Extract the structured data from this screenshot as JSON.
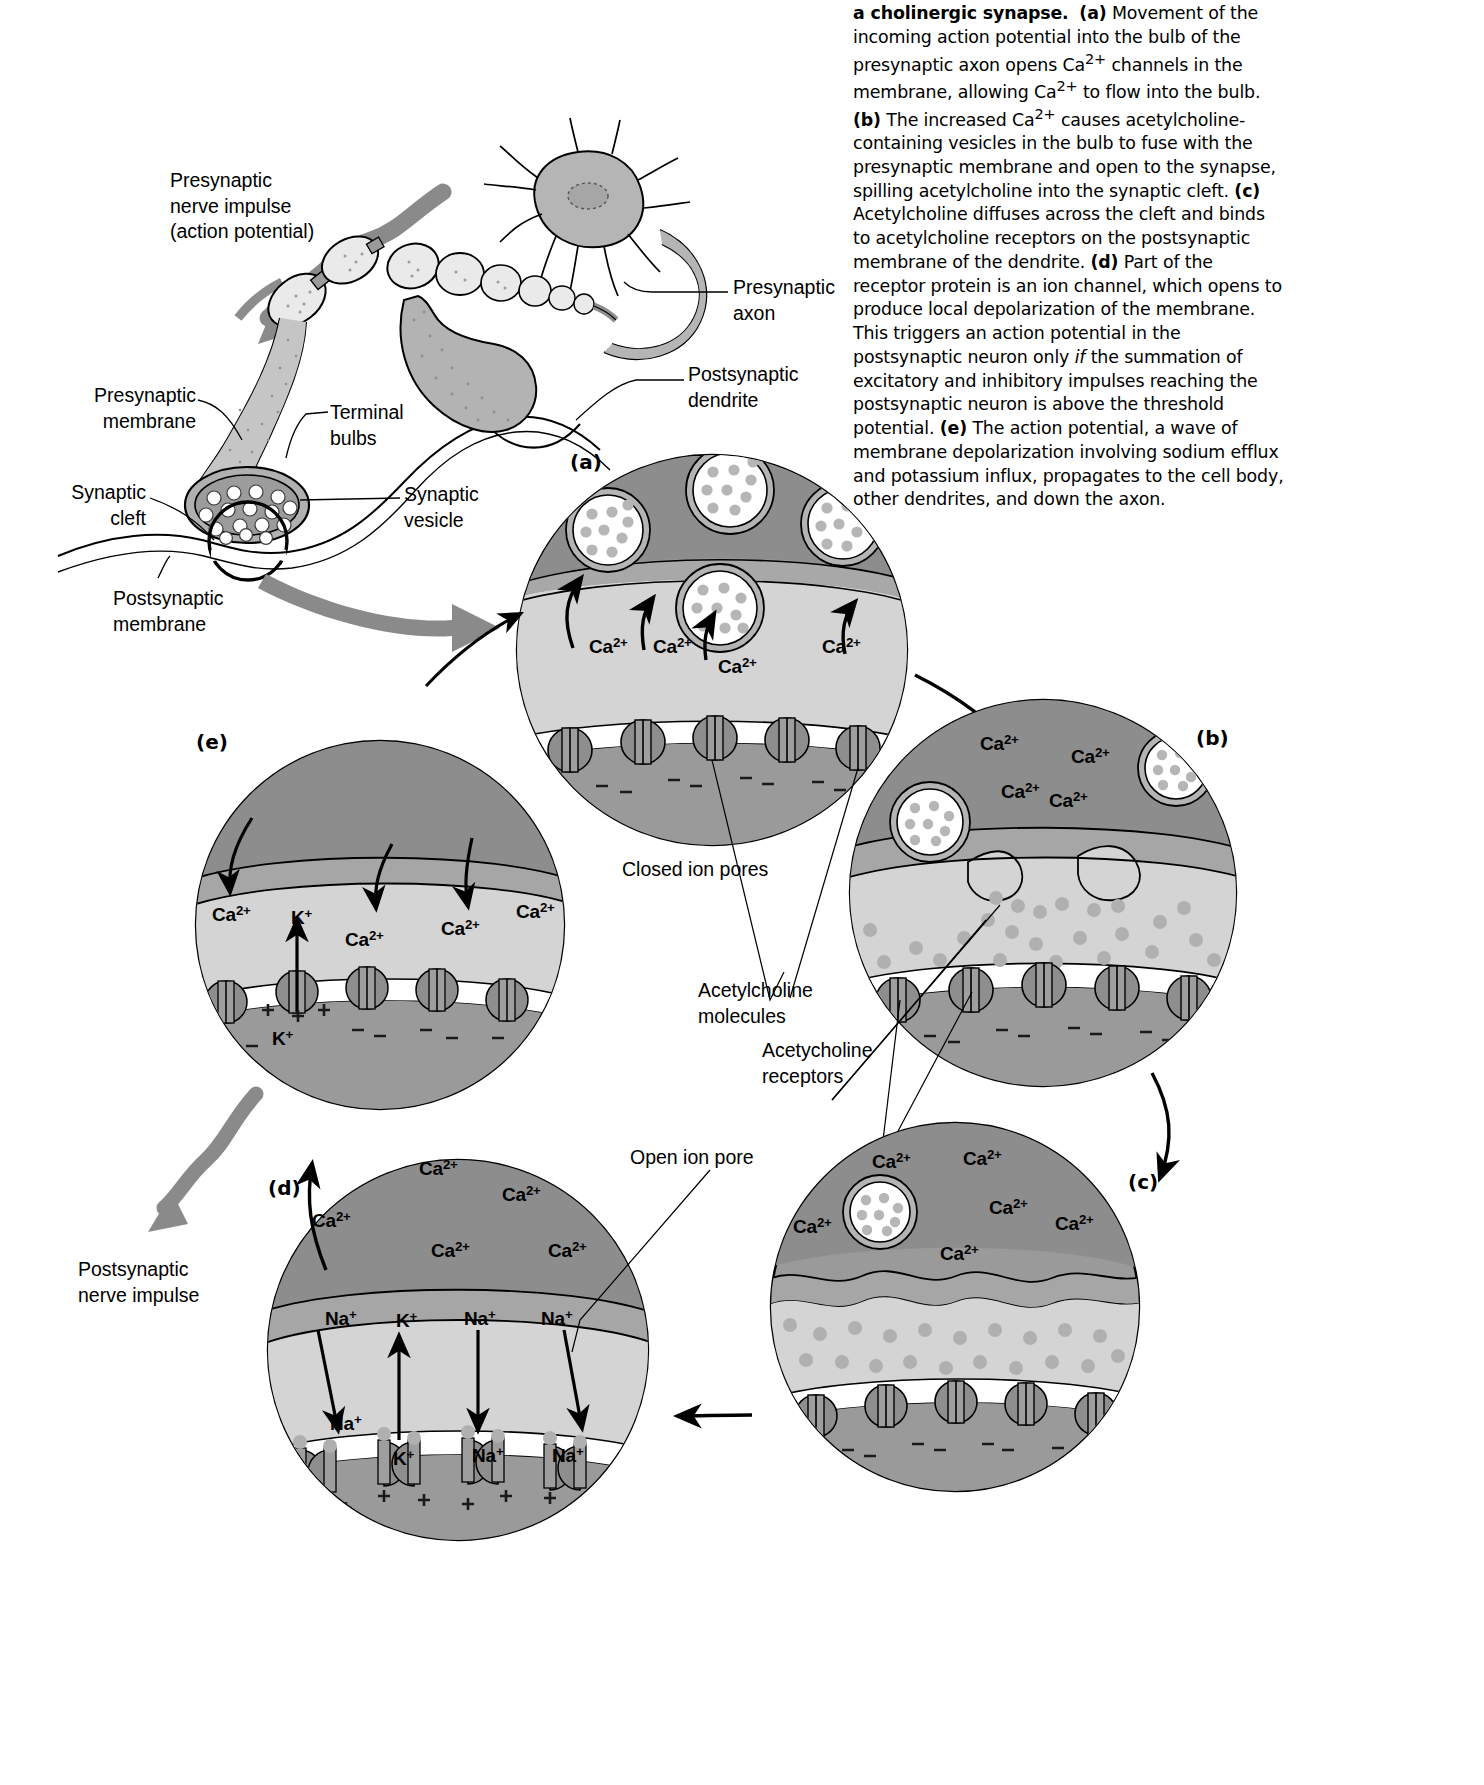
{
  "figure": {
    "caption_html": "<b>a cholinergic synapse.</b> &nbsp;<b>(a)</b> Movement of the incoming action potential into the bulb of the presynaptic axon opens Ca<sup>2+</sup> channels in the membrane, allowing Ca<sup>2+</sup> to flow into the bulb. <b>(b)</b> The increased Ca<sup>2+</sup> causes acetylcholine-containing vesicles in the bulb to fuse with the presynaptic membrane and open to the synapse, spilling acetylcholine into the synaptic cleft. <b>(c)</b> Acetylcholine diffuses across the cleft and binds to acetylcholine receptors on the postsynaptic membrane of the dendrite. <b>(d)</b> Part of the receptor protein is an ion channel, which opens to produce local depolarization of the membrane. This triggers an action potential in the postsynaptic neuron only <i>if</i> the summation of excitatory and inhibitory impulses reaching the postsynaptic neuron is above the threshold potential. <b>(e)</b> The action potential, a wave of membrane depolarization involving sodium efflux and potassium influx, propagates to the cell body, other dendrites, and down the axon.",
    "caption_plain": "a cholinergic synapse. (a) Movement of the incoming action potential into the bulb of the presynaptic axon opens Ca2+ channels in the membrane, allowing Ca2+ to flow into the bulb. (b) The increased Ca2+ causes acetylcholine-containing vesicles in the bulb to fuse with the presynaptic membrane and open to the synapse, spilling acetylcholine into the synaptic cleft. (c) Acetylcholine diffuses across the cleft and binds to acetylcholine receptors on the postsynaptic membrane of the dendrite. (d) Part of the receptor protein is an ion channel, which opens to produce local depolarization of the membrane. This triggers an action potential in the postsynaptic neuron only if the summation of excitatory and inhibitory impulses reaching the postsynaptic neuron is above the threshold potential. (e) The action potential, a wave of membrane depolarization involving sodium efflux and potassium influx, propagates to the cell body, other dendrites, and down the axon."
  },
  "overview_labels": {
    "presynaptic_impulse": "Presynaptic\nnerve impulse\n(action potential)",
    "presynaptic_axon": "Presynaptic\naxon",
    "presynaptic_membrane": "Presynaptic\nmembrane",
    "terminal_bulbs": "Terminal\nbulbs",
    "postsynaptic_dendrite": "Postsynaptic\ndendrite",
    "synaptic_cleft": "Synaptic\ncleft",
    "postsynaptic_membrane": "Postsynaptic\nmembrane",
    "synaptic_vesicle": "Synaptic\nvesicle",
    "postsynaptic_impulse": "Postsynaptic\nnerve impulse"
  },
  "callout_labels": {
    "closed_ion_pores": "Closed ion pores",
    "acetylcholine_molecules": "Acetylcholine\nmolecules",
    "acetylcholine_receptors": "Acetycholine\nreceptors",
    "open_ion_pore": "Open ion pore"
  },
  "panels": [
    {
      "id": "a",
      "letter": "(a)"
    },
    {
      "id": "b",
      "letter": "(b)"
    },
    {
      "id": "c",
      "letter": "(c)"
    },
    {
      "id": "d",
      "letter": "(d)"
    },
    {
      "id": "e",
      "letter": "(e)"
    }
  ],
  "ions": {
    "calcium": "Ca",
    "sodium": "Na",
    "potassium": "K",
    "charge_2plus": "2+",
    "charge_plus": "+"
  },
  "panel_a_ions": [
    {
      "label": "Ca",
      "sup": "2+",
      "x": 589,
      "y": 635
    },
    {
      "label": "Ca",
      "sup": "2+",
      "x": 653,
      "y": 635
    },
    {
      "label": "Ca",
      "sup": "2+",
      "x": 718,
      "y": 655
    },
    {
      "label": "Ca",
      "sup": "2+",
      "x": 822,
      "y": 635
    }
  ],
  "panel_b_ions": [
    {
      "label": "Ca",
      "sup": "2+",
      "x": 980,
      "y": 732
    },
    {
      "label": "Ca",
      "sup": "2+",
      "x": 1071,
      "y": 745
    },
    {
      "label": "Ca",
      "sup": "2+",
      "x": 1001,
      "y": 780
    },
    {
      "label": "Ca",
      "sup": "2+",
      "x": 1049,
      "y": 789
    }
  ],
  "panel_c_ions": [
    {
      "label": "Ca",
      "sup": "2+",
      "x": 872,
      "y": 1150
    },
    {
      "label": "Ca",
      "sup": "2+",
      "x": 963,
      "y": 1147
    },
    {
      "label": "Ca",
      "sup": "2+",
      "x": 989,
      "y": 1196
    },
    {
      "label": "Ca",
      "sup": "2+",
      "x": 1055,
      "y": 1212
    },
    {
      "label": "Ca",
      "sup": "2+",
      "x": 793,
      "y": 1215
    },
    {
      "label": "Ca",
      "sup": "2+",
      "x": 940,
      "y": 1242
    }
  ],
  "panel_d_ions_top": [
    {
      "label": "Ca",
      "sup": "2+",
      "x": 419,
      "y": 1157
    },
    {
      "label": "Ca",
      "sup": "2+",
      "x": 502,
      "y": 1183
    },
    {
      "label": "Ca",
      "sup": "2+",
      "x": 312,
      "y": 1209
    },
    {
      "label": "Ca",
      "sup": "2+",
      "x": 431,
      "y": 1239
    },
    {
      "label": "Ca",
      "sup": "2+",
      "x": 548,
      "y": 1239
    }
  ],
  "panel_d_ions_mid": [
    {
      "label": "Na",
      "sup": "+",
      "x": 325,
      "y": 1307
    },
    {
      "label": "K",
      "sup": "+",
      "x": 396,
      "y": 1309
    },
    {
      "label": "Na",
      "sup": "+",
      "x": 464,
      "y": 1307
    },
    {
      "label": "Na",
      "sup": "+",
      "x": 541,
      "y": 1307
    }
  ],
  "panel_d_ions_bottom": [
    {
      "label": "Na",
      "sup": "+",
      "x": 330,
      "y": 1412
    },
    {
      "label": "K",
      "sup": "+",
      "x": 393,
      "y": 1447
    },
    {
      "label": "Na",
      "sup": "+",
      "x": 472,
      "y": 1444
    },
    {
      "label": "Na",
      "sup": "+",
      "x": 552,
      "y": 1444
    }
  ],
  "panel_e_ions": [
    {
      "label": "Ca",
      "sup": "2+",
      "x": 212,
      "y": 903
    },
    {
      "label": "K",
      "sup": "+",
      "x": 291,
      "y": 906
    },
    {
      "label": "Ca",
      "sup": "2+",
      "x": 345,
      "y": 928
    },
    {
      "label": "Ca",
      "sup": "2+",
      "x": 441,
      "y": 917
    },
    {
      "label": "Ca",
      "sup": "2+",
      "x": 516,
      "y": 900
    },
    {
      "label": "K",
      "sup": "+",
      "x": 272,
      "y": 1027
    }
  ],
  "colors": {
    "cytoplasm_dark": "#8e8e8e",
    "cytoplasm_mid": "#a8a8a8",
    "cytoplasm_light": "#d6d6d6",
    "membrane_white": "#ffffff",
    "vesicle_fill": "#ffffff",
    "vesicle_dot": "#b0b0b0",
    "outline": "#000000",
    "arrow_gray": "#8a8a8a",
    "neuron_body": "#b5b5b5",
    "bulb_light": "#e8e8e8"
  }
}
